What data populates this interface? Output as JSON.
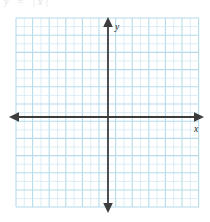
{
  "page": {
    "background_color": "#ffffff",
    "width": 210,
    "height": 222,
    "top_fragment_text": "y = |x|"
  },
  "figure": {
    "name": "blank-coordinate-plane",
    "grid": {
      "color_minor": "#cfe7f0",
      "color_major": "#b6dcea",
      "left": 16,
      "top": 18,
      "right": 199,
      "bottom": 207,
      "cell_size": 16.6,
      "columns": 11,
      "rows": 11,
      "visible": true
    },
    "axes": {
      "color": "#3c3c3c",
      "origin_x": 108,
      "origin_y": 117,
      "x_axis": {
        "label": "x",
        "start_x": 11,
        "end_x": 202,
        "arrow_left": true,
        "arrow_right": true,
        "label_x": 196,
        "label_y": 131
      },
      "y_axis": {
        "label": "y",
        "start_y": 19,
        "end_y": 212,
        "arrow_up": true,
        "arrow_down": true,
        "label_x": 115,
        "label_y": 30
      }
    },
    "plotted_data": {
      "type": "none",
      "series": []
    }
  }
}
